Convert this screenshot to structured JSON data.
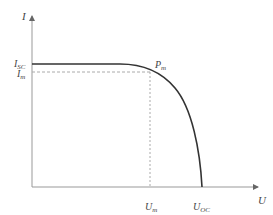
{
  "diagram": {
    "axes": {
      "y_label": "I",
      "x_label": "U"
    },
    "labels": {
      "isc_main": "I",
      "isc_sub": "SC",
      "im_main": "I",
      "im_sub": "m",
      "pm_main": "P",
      "pm_sub": "m",
      "um_main": "U",
      "um_sub": "m",
      "uoc_main": "U",
      "uoc_sub": "OC"
    },
    "colors": {
      "axis": "#999999",
      "curve": "#333333",
      "guide": "#aaaaaa"
    }
  }
}
